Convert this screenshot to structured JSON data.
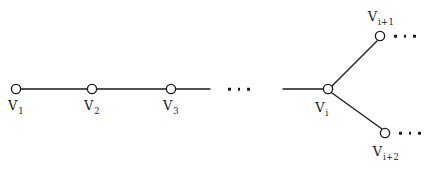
{
  "figure": {
    "background_color": "#ffffff",
    "ink_color": "#1b1b1b",
    "width": 433,
    "height": 177
  },
  "nodes": [
    {
      "id": "v1",
      "base": "V",
      "sub": "1",
      "cx": 16,
      "cy": 89,
      "r": 4.6,
      "label_x": 16,
      "label_y": 99,
      "label_pos": "below"
    },
    {
      "id": "v2",
      "base": "V",
      "sub": "2",
      "cx": 92,
      "cy": 89,
      "r": 4.6,
      "label_x": 92,
      "label_y": 99,
      "label_pos": "below"
    },
    {
      "id": "v3",
      "base": "V",
      "sub": "3",
      "cx": 171,
      "cy": 89,
      "r": 4.6,
      "label_x": 171,
      "label_y": 99,
      "label_pos": "below"
    },
    {
      "id": "vi",
      "base": "V",
      "sub": "i",
      "cx": 328,
      "cy": 89,
      "r": 4.6,
      "label_x": 322,
      "label_y": 101,
      "label_pos": "below"
    },
    {
      "id": "vi1",
      "base": "V",
      "sub": "i+1",
      "cx": 380,
      "cy": 36,
      "r": 4.6,
      "label_x": 381,
      "label_y": 10,
      "label_pos": "above"
    },
    {
      "id": "vi2",
      "base": "V",
      "sub": "i+2",
      "cx": 385,
      "cy": 133,
      "r": 4.6,
      "label_x": 386,
      "label_y": 145,
      "label_pos": "below"
    }
  ],
  "edges": [
    {
      "id": "e-v1-v2",
      "from": "v1",
      "to": "v2",
      "x1": 21,
      "y1": 89,
      "x2": 87,
      "y2": 89
    },
    {
      "id": "e-v2-v3",
      "from": "v2",
      "to": "v3",
      "x1": 97,
      "y1": 89,
      "x2": 166,
      "y2": 89
    },
    {
      "id": "e-v3-open",
      "from": "v3",
      "to": null,
      "x1": 176,
      "y1": 89,
      "x2": 210,
      "y2": 89
    },
    {
      "id": "e-open-vi",
      "from": null,
      "to": "vi",
      "x1": 283,
      "y1": 89,
      "x2": 323,
      "y2": 89
    },
    {
      "id": "e-vi-vi1",
      "from": "vi",
      "to": "vi1",
      "x1": 332,
      "y1": 86,
      "x2": 377,
      "y2": 41
    },
    {
      "id": "e-vi-vi2",
      "from": "vi",
      "to": "vi2",
      "x1": 332,
      "y1": 93,
      "x2": 382,
      "y2": 129
    }
  ],
  "ellipses": [
    {
      "id": "ellipsis-middle",
      "x": 228,
      "y": 89,
      "dots": 3
    },
    {
      "id": "ellipsis-upper",
      "x": 394,
      "y": 36,
      "dots": 3
    },
    {
      "id": "ellipsis-lower",
      "x": 399,
      "y": 133,
      "dots": 3
    }
  ]
}
